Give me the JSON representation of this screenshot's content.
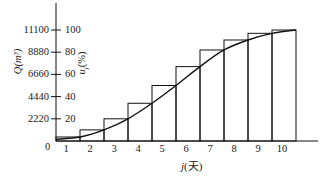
{
  "chart_data": {
    "type": "bar",
    "title": "",
    "xlabel": "j(天)",
    "ylabel_left": "Q(m³)",
    "ylabel_right": "u_j(%)",
    "origin_label": "0",
    "categories": [
      "1",
      "2",
      "3",
      "4",
      "5",
      "6",
      "7",
      "8",
      "9",
      "10"
    ],
    "series": [
      {
        "name": "cumulative percentage (bars)",
        "type": "bar",
        "values": [
          3.6,
          10,
          20,
          34,
          50,
          67,
          82,
          91,
          97,
          100
        ]
      },
      {
        "name": "fitted curve",
        "type": "line",
        "x": [
          0.5,
          1.5,
          2.5,
          3.5,
          4.5,
          5.5,
          6.5,
          7.5,
          8.5,
          9.5,
          10.5
        ],
        "values": [
          1.5,
          3.6,
          10,
          20,
          34,
          50,
          67,
          82,
          91,
          97,
          100
        ]
      }
    ],
    "y_left_ticks": [
      "2220",
      "4440",
      "6660",
      "8880",
      "11100"
    ],
    "y_right_ticks": [
      "20",
      "40",
      "60",
      "80",
      "100"
    ],
    "ylim": [
      0,
      100
    ],
    "grid": false,
    "legend": "none"
  }
}
